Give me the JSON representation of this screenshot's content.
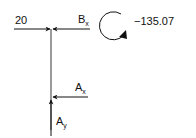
{
  "diagram": {
    "type": "free-body-diagram",
    "member": {
      "orientation": "vertical",
      "color": "#9a9a9a"
    },
    "forces": [
      {
        "id": "applied",
        "label": "20",
        "direction": "right",
        "position": "top"
      },
      {
        "id": "bx",
        "label_main": "B",
        "label_sub": "x",
        "direction": "left",
        "position": "top"
      },
      {
        "id": "ax",
        "label_main": "A",
        "label_sub": "x",
        "direction": "left",
        "position": "bottom"
      },
      {
        "id": "ay",
        "label_main": "A",
        "label_sub": "y",
        "direction": "up",
        "position": "bottom"
      }
    ],
    "moment": {
      "label": "−135.07",
      "direction": "clockwise"
    },
    "colors": {
      "arrow": "#111111",
      "member": "#9a9a9a",
      "background": "#ffffff"
    }
  }
}
